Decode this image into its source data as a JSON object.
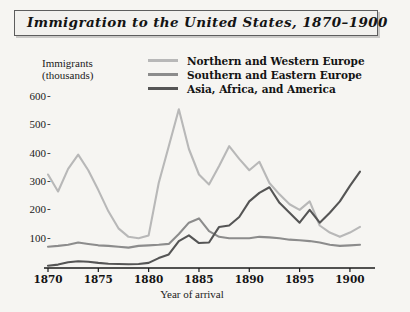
{
  "title": "Immigration to the United States, 1870–1900",
  "legend": {
    "position": "top-right",
    "items": [
      {
        "label": "Northern and Western Europe",
        "color": "#b8b8b8"
      },
      {
        "label": "Southern and Eastern Europe",
        "color": "#8c8c8c"
      },
      {
        "label": "Asia, Africa, and America",
        "color": "#555555"
      }
    ]
  },
  "axis": {
    "ylabel_line1": "Immigrants",
    "ylabel_line2": "(thousands)",
    "xlabel": "Year of arrival",
    "ytick_labels": [
      "600",
      "500",
      "400",
      "300",
      "200",
      "100"
    ],
    "ytick_dash": "-",
    "xtick_labels": [
      "1870",
      "1875",
      "1880",
      "1885",
      "1890",
      "1895",
      "1900"
    ]
  },
  "chart_data": {
    "type": "line",
    "title": "Immigration to the United States, 1870–1900",
    "xlabel": "Year of arrival",
    "ylabel": "Immigrants (thousands)",
    "xlim": [
      1870,
      1901
    ],
    "ylim": [
      0,
      640
    ],
    "grid": false,
    "legend_position": "top-right",
    "x": [
      1870,
      1871,
      1872,
      1873,
      1874,
      1875,
      1876,
      1877,
      1878,
      1879,
      1880,
      1881,
      1882,
      1883,
      1884,
      1885,
      1886,
      1887,
      1888,
      1889,
      1890,
      1891,
      1892,
      1893,
      1894,
      1895,
      1896,
      1897,
      1898,
      1899,
      1900,
      1901
    ],
    "series": [
      {
        "name": "Northern and Western Europe",
        "color": "#b8b8b8",
        "values": [
          330,
          270,
          350,
          400,
          345,
          275,
          200,
          140,
          110,
          105,
          115,
          300,
          430,
          560,
          420,
          330,
          295,
          360,
          430,
          385,
          345,
          375,
          300,
          260,
          225,
          205,
          235,
          150,
          125,
          110,
          125,
          145
        ]
      },
      {
        "name": "Southern and Eastern Europe",
        "color": "#8c8c8c",
        "values": [
          75,
          78,
          82,
          90,
          85,
          80,
          78,
          75,
          72,
          78,
          80,
          82,
          85,
          120,
          160,
          175,
          130,
          110,
          105,
          105,
          105,
          110,
          108,
          105,
          100,
          98,
          95,
          90,
          82,
          78,
          80,
          82
        ]
      },
      {
        "name": "Asia, Africa, and America",
        "color": "#555555",
        "values": [
          8,
          12,
          20,
          24,
          22,
          18,
          15,
          14,
          13,
          14,
          18,
          35,
          48,
          95,
          115,
          88,
          90,
          145,
          150,
          180,
          235,
          265,
          285,
          230,
          195,
          160,
          205,
          160,
          195,
          235,
          290,
          340
        ]
      }
    ]
  }
}
